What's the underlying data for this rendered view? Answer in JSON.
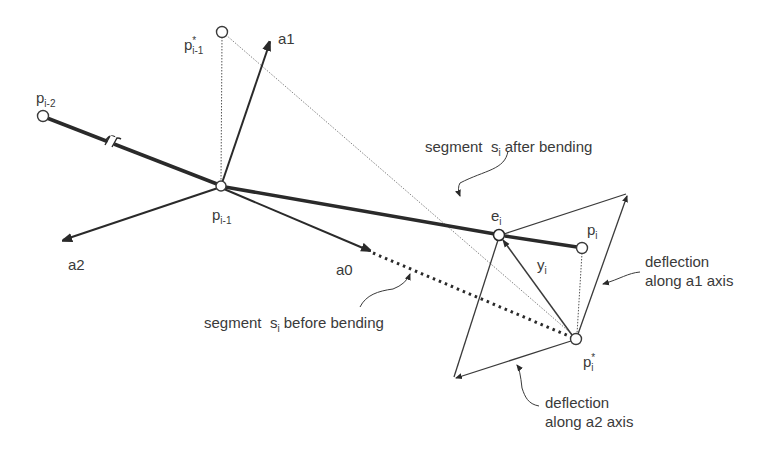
{
  "diagram": {
    "points": {
      "p_i_minus_2": {
        "base": "p",
        "sub": "i-2",
        "sup": ""
      },
      "p_i_minus_1": {
        "base": "p",
        "sub": "i-1",
        "sup": ""
      },
      "p_star_i_minus_1": {
        "base": "p",
        "sub": "i-1",
        "sup": "*"
      },
      "e_i": {
        "base": "e",
        "sub": "i",
        "sup": ""
      },
      "p_i": {
        "base": "p",
        "sub": "i",
        "sup": ""
      },
      "p_star_i": {
        "base": "p",
        "sub": "i",
        "sup": "*"
      },
      "y_i": {
        "base": "y",
        "sub": "i",
        "sup": ""
      }
    },
    "axes": {
      "a0": "a0",
      "a1": "a1",
      "a2": "a2"
    },
    "annotations": {
      "after_bending": {
        "prefix": "segment  ",
        "base": "s",
        "sub": "i",
        "suffix": " after bending"
      },
      "before_bending": {
        "prefix": "segment  ",
        "base": "s",
        "sub": "i",
        "suffix": " before bending"
      },
      "deflection_a1": {
        "line1": "deflection",
        "line2": "along a1 axis"
      },
      "deflection_a2": {
        "line1": "deflection",
        "line2": "along a2 axis"
      }
    },
    "colors": {
      "stroke": "#2a2a2a",
      "thin": "#4a4a4a",
      "text": "#3a3a3a"
    }
  }
}
